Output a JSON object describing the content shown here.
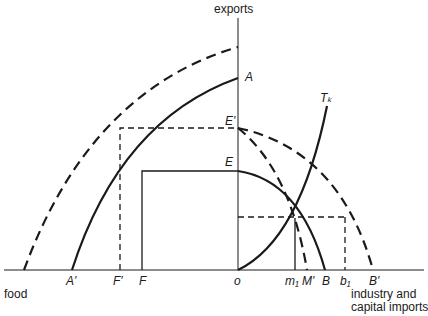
{
  "axes": {
    "y_label": "exports",
    "x_left_label": "food",
    "x_right_label_line1": "industry and",
    "x_right_label_line2": "capital imports",
    "origin_label": "o"
  },
  "points": {
    "A": "A",
    "E_prime": "E'",
    "E": "E",
    "A_prime": "A'",
    "F_prime": "F'",
    "F": "F",
    "m1": "m₁",
    "M_prime": "M'",
    "B": "B",
    "b1": "b₁",
    "B_prime": "B'",
    "T_k": "Tₖ"
  },
  "colors": {
    "ink": "#1a1a1a",
    "background": "#ffffff"
  }
}
